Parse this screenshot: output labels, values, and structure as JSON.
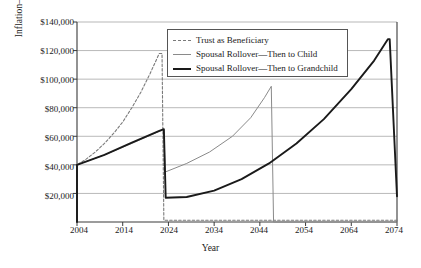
{
  "chart_data": {
    "type": "line",
    "title": "",
    "xlabel": "Year",
    "ylabel": "Inflation–Adjusted Dollars",
    "xlim": [
      2004,
      2074
    ],
    "ylim": [
      0,
      140000
    ],
    "grid": true,
    "legend_position": "top-center",
    "x_ticks": [
      "2004",
      "2014",
      "2024",
      "2034",
      "2044",
      "2054",
      "2064",
      "2074"
    ],
    "x_tick_values": [
      2004,
      2014,
      2024,
      2034,
      2044,
      2054,
      2064,
      2074
    ],
    "y_ticks": [
      "$20,000",
      "$40,000",
      "$60,000",
      "$80,000",
      "$100,000",
      "$120,000",
      "$140,000"
    ],
    "y_tick_values": [
      20000,
      40000,
      60000,
      80000,
      100000,
      120000,
      140000
    ],
    "series": [
      {
        "name": "Trust as Beneficiary",
        "style": "dashed",
        "color": "#7a7a7a",
        "points": [
          [
            2004,
            0
          ],
          [
            2004,
            40000
          ],
          [
            2006,
            44000
          ],
          [
            2008,
            49000
          ],
          [
            2010,
            55000
          ],
          [
            2012,
            62000
          ],
          [
            2014,
            70000
          ],
          [
            2016,
            80000
          ],
          [
            2018,
            91000
          ],
          [
            2020,
            104000
          ],
          [
            2022,
            118000
          ],
          [
            2022.6,
            118000
          ],
          [
            2023,
            1200
          ],
          [
            2074,
            1200
          ]
        ]
      },
      {
        "name": "Spousal Rollover—Then to Child",
        "style": "solid-thin",
        "color": "#8a8a8a",
        "points": [
          [
            2004,
            0
          ],
          [
            2004,
            40000
          ],
          [
            2010,
            47000
          ],
          [
            2016,
            55000
          ],
          [
            2022,
            63500
          ],
          [
            2023,
            64500
          ],
          [
            2023.3,
            35000
          ],
          [
            2028,
            41000
          ],
          [
            2033,
            49000
          ],
          [
            2038,
            60000
          ],
          [
            2042,
            73000
          ],
          [
            2045,
            87000
          ],
          [
            2046.5,
            95000
          ],
          [
            2047,
            0
          ],
          [
            2074,
            0
          ]
        ]
      },
      {
        "name": "Spousal Rollover—Then to Grandchild",
        "style": "solid-thick",
        "color": "#1a1a1a",
        "points": [
          [
            2004,
            0
          ],
          [
            2004,
            40000
          ],
          [
            2010,
            47000
          ],
          [
            2016,
            55500
          ],
          [
            2022,
            63800
          ],
          [
            2023,
            65000
          ],
          [
            2023.4,
            17000
          ],
          [
            2028,
            17500
          ],
          [
            2034,
            22000
          ],
          [
            2040,
            30000
          ],
          [
            2046,
            41000
          ],
          [
            2052,
            55000
          ],
          [
            2058,
            72000
          ],
          [
            2064,
            93000
          ],
          [
            2069,
            113000
          ],
          [
            2072,
            128000
          ],
          [
            2072.4,
            128000
          ],
          [
            2074,
            18000
          ]
        ]
      }
    ]
  },
  "legend": {
    "entries": [
      {
        "label": "Trust as Beneficiary",
        "key": "dashed-line-key"
      },
      {
        "label": "Spousal Rollover—Then to Child",
        "key": "thin-line-key"
      },
      {
        "label": "Spousal Rollover—Then to Grandchild",
        "key": "thick-line-key"
      }
    ]
  },
  "axes": {
    "y_title": "Inflation–Adjusted Dollars",
    "x_title": "Year"
  }
}
